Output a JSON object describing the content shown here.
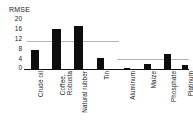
{
  "chart_data": {
    "type": "bar",
    "title": "",
    "ylabel": "RMSE",
    "xlabel": "",
    "categories": [
      "Crude oil",
      "Coffee,\nRobusta",
      "Natural rubber",
      "Tin",
      "Aluminum",
      "Maize",
      "Phosphate",
      "Platinum"
    ],
    "values": [
      7.5,
      15.5,
      17.0,
      4.5,
      0.5,
      2.0,
      6.0,
      1.5
    ],
    "ylim": [
      0,
      20
    ],
    "yticks": [
      0,
      4,
      8,
      12,
      16,
      20
    ],
    "ytick_labels": [
      "0",
      "4",
      "8",
      "12",
      "16",
      "20"
    ],
    "grid": false,
    "legend": "none",
    "reference_lines": [
      {
        "name": "left-group-mean",
        "value": 11.0,
        "span_categories": [
          "Crude oil",
          "Coffee, Robusta",
          "Natural rubber"
        ],
        "color": "#b4b4b4"
      },
      {
        "name": "right-group-mean",
        "value": 4.0,
        "span_categories": [
          "Aluminum",
          "Maize",
          "Phosphate",
          "Platinum"
        ],
        "color": "#b4b4b4"
      }
    ],
    "bar_color": "#0d0d0d",
    "axis_color": "#111111",
    "background": "#ffffff"
  },
  "axis": {
    "y_title": "RMSE"
  }
}
